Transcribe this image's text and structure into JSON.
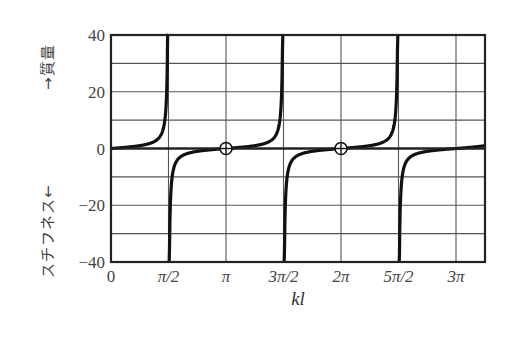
{
  "chart_data": {
    "type": "line",
    "title": "",
    "function": "tan(kl)",
    "xlabel": "kl",
    "ylabel_upper": "→質量",
    "ylabel_lower": "スチフネス←",
    "xlim_in_pi": [
      0,
      3.25
    ],
    "ylim": [
      -40,
      40
    ],
    "x_ticks": [
      {
        "value_in_pi": 0,
        "label": "0"
      },
      {
        "value_in_pi": 0.5,
        "label": "π/2"
      },
      {
        "value_in_pi": 1,
        "label": "π"
      },
      {
        "value_in_pi": 1.5,
        "label": "3π/2"
      },
      {
        "value_in_pi": 2,
        "label": "2π"
      },
      {
        "value_in_pi": 2.5,
        "label": "5π/2"
      },
      {
        "value_in_pi": 3,
        "label": "3π"
      }
    ],
    "y_ticks": [
      {
        "value": 40,
        "label": "40"
      },
      {
        "value": 20,
        "label": "20"
      },
      {
        "value": 0,
        "label": "0"
      },
      {
        "value": -20,
        "label": "−20"
      },
      {
        "value": -40,
        "label": "−40"
      }
    ],
    "y_grid_step": 10,
    "grid": true,
    "asymptotes_in_pi": [
      0.5,
      1.5,
      2.5
    ],
    "marked_points": [
      {
        "x_in_pi": 1,
        "y": 0,
        "marker": "circle-plus"
      },
      {
        "x_in_pi": 2,
        "y": 0,
        "marker": "circle-plus"
      }
    ],
    "sample_points": [
      {
        "x_in_pi": 0.0,
        "y": 0.0
      },
      {
        "x_in_pi": 0.25,
        "y": 1.0
      },
      {
        "x_in_pi": 0.4,
        "y": 3.08
      },
      {
        "x_in_pi": 0.45,
        "y": 6.31
      },
      {
        "x_in_pi": 0.48,
        "y": 15.89
      },
      {
        "x_in_pi": 0.49,
        "y": 31.82
      },
      {
        "x_in_pi": 0.51,
        "y": -31.82
      },
      {
        "x_in_pi": 0.55,
        "y": -6.31
      },
      {
        "x_in_pi": 0.75,
        "y": -1.0
      },
      {
        "x_in_pi": 1.0,
        "y": 0.0
      },
      {
        "x_in_pi": 1.25,
        "y": 1.0
      },
      {
        "x_in_pi": 1.45,
        "y": 6.31
      },
      {
        "x_in_pi": 1.55,
        "y": -6.31
      },
      {
        "x_in_pi": 2.0,
        "y": 0.0
      },
      {
        "x_in_pi": 2.45,
        "y": 6.31
      },
      {
        "x_in_pi": 2.55,
        "y": -6.31
      },
      {
        "x_in_pi": 3.0,
        "y": 0.0
      },
      {
        "x_in_pi": 3.25,
        "y": 1.0
      }
    ]
  },
  "axis": {
    "xlabel": "kl",
    "ylabel_upper": "→質量",
    "ylabel_lower": "スチフネス←"
  },
  "colors": {
    "curve": "#111111",
    "grid": "#555555",
    "frame": "#222222",
    "text": "#444444"
  }
}
